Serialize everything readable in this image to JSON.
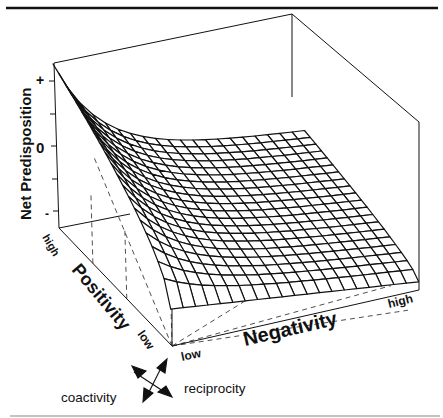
{
  "chart_data": {
    "type": "surface3d",
    "title": "",
    "zlabel": "Net Predisposition",
    "z_ticks": [
      "+",
      "0",
      "-"
    ],
    "x_axis": {
      "label": "Negativity",
      "ticks": [
        "low",
        "high"
      ]
    },
    "y_axis": {
      "label": "Positivity",
      "ticks": [
        "low",
        "high"
      ]
    },
    "legend": {
      "arrows": [
        "coactivity",
        "reciprocity"
      ]
    },
    "grid_size": 20,
    "corner_values": {
      "pos_high_neg_low": 1.0,
      "pos_high_neg_high": -0.2,
      "pos_low_neg_low": -0.55,
      "pos_low_neg_high": -0.9
    }
  },
  "labels": {
    "zlabel": "Net Predisposition",
    "z_plus": "+",
    "z_zero": "0",
    "z_minus": "-",
    "pos_label": "Positivity",
    "pos_high": "high",
    "pos_low": "low",
    "neg_label": "Negativity",
    "neg_low": "low",
    "neg_high": "high",
    "coactivity": "coactivity",
    "reciprocity": "reciprocity"
  },
  "colors": {
    "ink": "#111111",
    "background": "#ffffff"
  }
}
